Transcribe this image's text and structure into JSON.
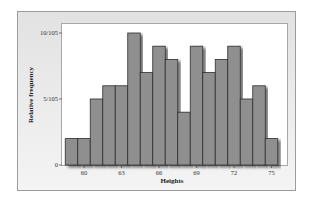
{
  "chart_data": {
    "type": "bar",
    "title": "",
    "xlabel": "Heights",
    "ylabel": "Relative frequency",
    "bin_width": 1,
    "bin_start": 58.5,
    "categories": [
      "59",
      "60",
      "61",
      "62",
      "63",
      "64",
      "65",
      "66",
      "67",
      "68",
      "69",
      "70",
      "71",
      "72",
      "73",
      "74",
      "75"
    ],
    "values": [
      2,
      2,
      5,
      6,
      6,
      10,
      7,
      9,
      8,
      4,
      9,
      7,
      8,
      9,
      5,
      6,
      2
    ],
    "value_unit": "count out of 105",
    "x_ticks": [
      "60",
      "63",
      "66",
      "69",
      "72",
      "75"
    ],
    "y_ticks": [
      "0",
      "5/105",
      "10/105"
    ],
    "ylim": [
      0,
      10.7
    ],
    "xlim": [
      58.3,
      76.2
    ],
    "grid": false,
    "legend": null,
    "bar_color": "#8f8f8f"
  }
}
